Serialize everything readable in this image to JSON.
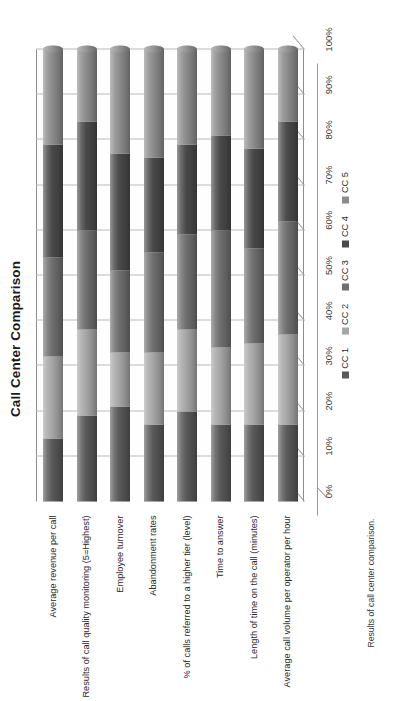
{
  "chart_data": {
    "type": "bar",
    "orientation": "horizontal",
    "stacked": "100%",
    "title": "Call Center Comparison",
    "xlabel": "",
    "ylabel": "",
    "xlim": [
      0,
      100
    ],
    "grid": true,
    "legend_position": "bottom",
    "tick_labels": [
      "0%",
      "10%",
      "20%",
      "30%",
      "40%",
      "50%",
      "60%",
      "70%",
      "80%",
      "90%",
      "100%"
    ],
    "tick_values": [
      0,
      10,
      20,
      30,
      40,
      50,
      60,
      70,
      80,
      90,
      100
    ],
    "categories": [
      "Average revenue per call",
      "Results of call quality monitoring (5=Highest)",
      "Employee turnover",
      "Abandonment rates",
      "% of calls referred to a higher tier (level)",
      "Time to answer",
      "Length of time on the call (minutes)",
      "Average call volume per operator per hour"
    ],
    "series": [
      {
        "name": "CC 1",
        "color": "#595959",
        "values": [
          14,
          19,
          21,
          17,
          20,
          17,
          17,
          17
        ]
      },
      {
        "name": "CC 2",
        "color": "#a6a6a6",
        "values": [
          18,
          19,
          12,
          16,
          18,
          17,
          18,
          20
        ]
      },
      {
        "name": "CC 3",
        "color": "#6f6f6f",
        "values": [
          22,
          22,
          18,
          22,
          21,
          26,
          21,
          25
        ]
      },
      {
        "name": "CC 4",
        "color": "#4a4a4a",
        "values": [
          25,
          24,
          26,
          21,
          20,
          21,
          22,
          22
        ]
      },
      {
        "name": "CC 5",
        "color": "#8c8c8c",
        "values": [
          21,
          16,
          23,
          24,
          21,
          19,
          22,
          16
        ]
      }
    ]
  },
  "legend": {
    "items": [
      {
        "label": "CC 1"
      },
      {
        "label": "CC 2"
      },
      {
        "label": "CC 3"
      },
      {
        "label": "CC 4"
      },
      {
        "label": "CC 5"
      }
    ]
  },
  "caption": {
    "text": "Results of call center comparison."
  }
}
